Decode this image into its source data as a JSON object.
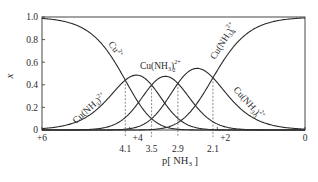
{
  "chart_data": {
    "type": "line",
    "title": "",
    "xlabel": "p[NH3]",
    "xlabel_display": "p[ NH",
    "xlabel_sub": "3",
    "xlabel_close": " ]",
    "ylabel": "x",
    "xlim": [
      6,
      0
    ],
    "ylim": [
      0,
      1.0
    ],
    "x_axis_reversed": true,
    "grid": false,
    "legend": "none (curves labeled inline)",
    "y_ticks": [
      "0",
      "0.2",
      "0.4",
      "0.6",
      "0.8",
      "1.0"
    ],
    "y_tick_values": [
      0,
      0.2,
      0.4,
      0.6,
      0.8,
      1.0
    ],
    "x_ticks": [
      "+6",
      "+4",
      "+2",
      "0"
    ],
    "x_tick_values": [
      6,
      4,
      2,
      0
    ],
    "crossover_markers": [
      {
        "label": "4.1",
        "x": 4.1
      },
      {
        "label": "3.5",
        "x": 3.5
      },
      {
        "label": "2.9",
        "x": 2.9
      },
      {
        "label": "2.1",
        "x": 2.1
      }
    ],
    "stepwise_logK": [
      4.1,
      3.5,
      2.9,
      2.1
    ],
    "series": [
      {
        "name": "Cu2+",
        "label_base": "Cu",
        "label_sup": "2+",
        "label_sub": "",
        "n": 0
      },
      {
        "name": "Cu(NH3)2+",
        "label_base": "Cu(NH",
        "label_sub": "3",
        "label_close": ")",
        "label_sup": "2+",
        "label_sub2": "",
        "n": 1
      },
      {
        "name": "Cu(NH3)2 2+",
        "label_base": "Cu(NH",
        "label_sub": "3",
        "label_close": ")",
        "label_sup": "2+",
        "label_sub2": "2",
        "n": 2
      },
      {
        "name": "Cu(NH3)3 2+",
        "label_base": "Cu(NH",
        "label_sub": "3",
        "label_close": ")",
        "label_sup": "2+",
        "label_sub2": "3",
        "n": 3
      },
      {
        "name": "Cu(NH3)4 2+",
        "label_base": "Cu(NH",
        "label_sub": "3",
        "label_close": ")",
        "label_sup": "2+",
        "label_sub2": "4",
        "n": 4
      }
    ],
    "approx_peaks": [
      {
        "species": "Cu(NH3)2+",
        "x": 3.8,
        "y": 0.46
      },
      {
        "species": "Cu(NH3)2 2+",
        "x": 3.2,
        "y": 0.47
      },
      {
        "species": "Cu(NH3)3 2+",
        "x": 2.5,
        "y": 0.52
      }
    ],
    "colors": {
      "line": "#2a2a2a",
      "dashed": "#555555",
      "axis": "#333333"
    }
  }
}
